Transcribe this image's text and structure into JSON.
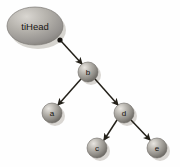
{
  "diagram": {
    "type": "binary-tree",
    "background_color": "#fefefe",
    "head_pointer": {
      "label": "tiHead",
      "shape": "ellipse",
      "cx": 35,
      "cy": 26,
      "rx": 28,
      "ry": 19,
      "fill_light": "#d8d5d0",
      "fill_dark": "#8a8781",
      "origin_dot": {
        "x": 60,
        "y": 40,
        "r": 2.6,
        "color": "#15120f"
      }
    },
    "nodes": [
      {
        "id": "b",
        "label": "b",
        "cx": 88,
        "cy": 72,
        "r": 10
      },
      {
        "id": "a",
        "label": "a",
        "cx": 52,
        "cy": 113,
        "r": 10
      },
      {
        "id": "d",
        "label": "d",
        "cx": 124,
        "cy": 113,
        "r": 10
      },
      {
        "id": "c",
        "label": "c",
        "cx": 97,
        "cy": 148,
        "r": 10
      },
      {
        "id": "e",
        "label": "e",
        "cx": 157,
        "cy": 148,
        "r": 10
      }
    ],
    "node_style": {
      "fill_highlight": "#e3e0db",
      "fill_mid": "#a9a6a0",
      "fill_shadow": "#6e6b66",
      "edge_color": "#2a2724",
      "shadow_color": "#c9c6c1"
    },
    "edges": [
      {
        "id": "head-to-b",
        "from": "tiHead",
        "to": "b",
        "x1": 61,
        "y1": 41,
        "x2": 82,
        "y2": 64
      },
      {
        "id": "b-to-a",
        "from": "b",
        "to": "a",
        "x1": 81,
        "y1": 79,
        "x2": 58,
        "y2": 105
      },
      {
        "id": "b-to-d",
        "from": "b",
        "to": "d",
        "x1": 95,
        "y1": 79,
        "x2": 118,
        "y2": 105
      },
      {
        "id": "d-to-c",
        "from": "d",
        "to": "c",
        "x1": 117,
        "y1": 120,
        "x2": 104,
        "y2": 140
      },
      {
        "id": "d-to-e",
        "from": "d",
        "to": "e",
        "x1": 131,
        "y1": 120,
        "x2": 150,
        "y2": 140
      }
    ]
  }
}
